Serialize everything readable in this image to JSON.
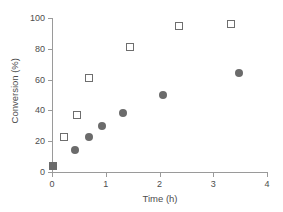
{
  "chart_data": {
    "type": "scatter",
    "title": "",
    "xlabel": "Time (h)",
    "ylabel": "Conversion (%)",
    "xlim": [
      0,
      4
    ],
    "ylim": [
      0,
      100
    ],
    "xticks": [
      0,
      1,
      2,
      3,
      4
    ],
    "yticks": [
      0,
      20,
      40,
      60,
      80,
      100
    ],
    "xtick_labels": [
      "0",
      "1",
      "2",
      "3",
      "4"
    ],
    "ytick_labels": [
      "0",
      "20",
      "40",
      "60",
      "80",
      "100"
    ],
    "grid": false,
    "legend": "none",
    "series": [
      {
        "name": "open-squares",
        "marker": "open-square",
        "color": "#6e6e6e",
        "points": [
          {
            "x": 0.02,
            "y": 4
          },
          {
            "x": 0.22,
            "y": 23
          },
          {
            "x": 0.46,
            "y": 37
          },
          {
            "x": 0.69,
            "y": 61
          },
          {
            "x": 1.46,
            "y": 81
          },
          {
            "x": 2.36,
            "y": 95
          },
          {
            "x": 3.33,
            "y": 96
          }
        ]
      },
      {
        "name": "filled-circles",
        "marker": "filled-circle",
        "color": "#6b6b6b",
        "points": [
          {
            "x": 0.02,
            "y": 4
          },
          {
            "x": 0.42,
            "y": 14
          },
          {
            "x": 0.68,
            "y": 23
          },
          {
            "x": 0.93,
            "y": 30
          },
          {
            "x": 1.33,
            "y": 38
          },
          {
            "x": 2.07,
            "y": 50
          },
          {
            "x": 3.48,
            "y": 64
          }
        ]
      }
    ]
  },
  "colors": {
    "axis": "#9a9a9a",
    "text": "#4d4d4d",
    "background": "#ffffff",
    "open_square": "#6e6e6e",
    "filled_circle": "#6b6b6b"
  }
}
